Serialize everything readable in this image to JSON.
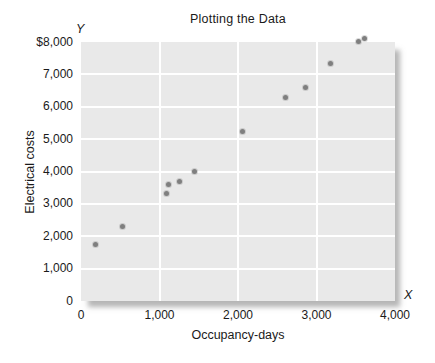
{
  "axes": {
    "y_symbol": "Y",
    "x_symbol": "X"
  },
  "chart_data": {
    "type": "scatter",
    "title": "Plotting the Data",
    "xlabel": "Occupancy-days",
    "ylabel": "Electrical costs",
    "xlim": [
      0,
      4000
    ],
    "ylim": [
      0,
      8000
    ],
    "grid": true,
    "legend_position": "none",
    "x_ticks": [
      {
        "value": 0,
        "label": "0"
      },
      {
        "value": 1000,
        "label": "1,000"
      },
      {
        "value": 2000,
        "label": "2,000"
      },
      {
        "value": 3000,
        "label": "3,000"
      },
      {
        "value": 4000,
        "label": "4,000"
      }
    ],
    "y_ticks": [
      {
        "value": 0,
        "label": "0"
      },
      {
        "value": 1000,
        "label": "1,000"
      },
      {
        "value": 2000,
        "label": "2,000"
      },
      {
        "value": 3000,
        "label": "3,000"
      },
      {
        "value": 4000,
        "label": "4,000"
      },
      {
        "value": 5000,
        "label": "5,000"
      },
      {
        "value": 6000,
        "label": "6,000"
      },
      {
        "value": 7000,
        "label": "7,000"
      },
      {
        "value": 8000,
        "label": "$8,000"
      }
    ],
    "points": [
      {
        "x": 190,
        "y": 1730
      },
      {
        "x": 530,
        "y": 2290
      },
      {
        "x": 1085,
        "y": 3330
      },
      {
        "x": 1115,
        "y": 3600
      },
      {
        "x": 1260,
        "y": 3700
      },
      {
        "x": 1440,
        "y": 4000
      },
      {
        "x": 2055,
        "y": 5240
      },
      {
        "x": 2610,
        "y": 6300
      },
      {
        "x": 2860,
        "y": 6580
      },
      {
        "x": 3175,
        "y": 7350
      },
      {
        "x": 3530,
        "y": 8030
      },
      {
        "x": 3615,
        "y": 8100
      }
    ],
    "colors": {
      "point": "#7f7f7f",
      "plot_bg": "#e9e9e9",
      "grid": "#ffffff",
      "text": "#1a1a1a"
    }
  }
}
